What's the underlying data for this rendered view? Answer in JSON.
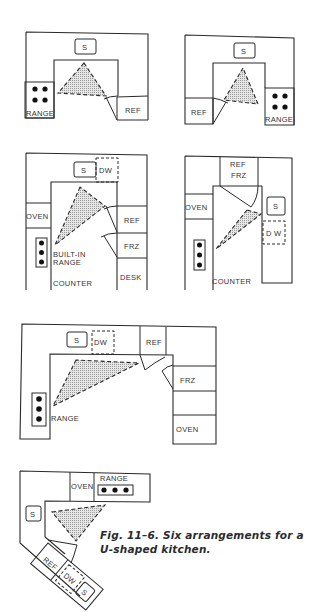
{
  "figure": {
    "caption": {
      "line1": "Fig. 11–6. Six arrangements for a",
      "line2": "U-shaped kitchen."
    },
    "colors": {
      "line": "#2a2a2a",
      "triangle_fill": "#d6d6d6",
      "background": "#ffffff"
    },
    "layouts": [
      {
        "id": 1,
        "labels": {
          "sink": "S",
          "range": "RANGE",
          "ref": "REF"
        }
      },
      {
        "id": 2,
        "labels": {
          "sink": "S",
          "range": "RANGE",
          "ref": "REF"
        }
      },
      {
        "id": 3,
        "labels": {
          "sink": "S",
          "dw": "DW",
          "oven": "OVEN",
          "ref": "REF",
          "frz": "FRZ",
          "desk": "DESK",
          "builtin_range_1": "BUILT-IN",
          "builtin_range_2": "RANGE",
          "counter": "COUNTER"
        }
      },
      {
        "id": 4,
        "labels": {
          "ref": "REF",
          "frz": "FRZ",
          "oven": "OVEN",
          "sink": "S",
          "dw": "D W",
          "counter": "COUNTER"
        }
      },
      {
        "id": 5,
        "labels": {
          "sink": "S",
          "dw": "DW",
          "ref": "REF",
          "frz": "FRZ",
          "oven": "OVEN",
          "range": "RANGE"
        }
      },
      {
        "id": 6,
        "labels": {
          "oven": "OVEN",
          "range": "RANGE",
          "sink": "S",
          "ref": "REF",
          "dw": "DW",
          "sink2": "S"
        }
      }
    ]
  }
}
